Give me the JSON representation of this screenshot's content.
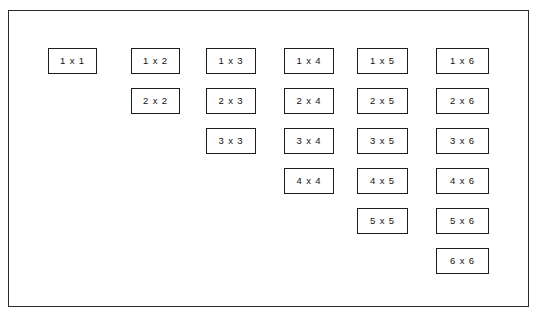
{
  "diagram": {
    "background_color": "#ffffff",
    "frame": {
      "name": "outer-frame",
      "border_color": "#2b2b2b",
      "x": 8,
      "y": 10,
      "width": 521,
      "height": 297
    },
    "box_style": {
      "border_color": "#1d1d1d",
      "fill_color": "#ffffff",
      "text_color": "#111111",
      "height": 26
    },
    "separator": "x",
    "columns": [
      {
        "index": 1,
        "x": 48,
        "width": 49,
        "rows": 1
      },
      {
        "index": 2,
        "x": 131,
        "width": 49,
        "rows": 2
      },
      {
        "index": 3,
        "x": 206,
        "width": 50,
        "rows": 3
      },
      {
        "index": 4,
        "x": 284,
        "width": 50,
        "rows": 4
      },
      {
        "index": 5,
        "x": 357,
        "width": 51,
        "rows": 5
      },
      {
        "index": 6,
        "x": 436,
        "width": 53,
        "rows": 6
      }
    ],
    "row_tops": [
      48,
      88,
      128,
      168,
      208,
      248
    ],
    "boxes": [
      {
        "label": "1 x 1",
        "col": 1,
        "row": 1
      },
      {
        "label": "1 x 2",
        "col": 2,
        "row": 1
      },
      {
        "label": "2 x 2",
        "col": 2,
        "row": 2
      },
      {
        "label": "1 x 3",
        "col": 3,
        "row": 1
      },
      {
        "label": "2 x 3",
        "col": 3,
        "row": 2
      },
      {
        "label": "3 x 3",
        "col": 3,
        "row": 3
      },
      {
        "label": "1 x 4",
        "col": 4,
        "row": 1
      },
      {
        "label": "2 x 4",
        "col": 4,
        "row": 2
      },
      {
        "label": "3 x 4",
        "col": 4,
        "row": 3
      },
      {
        "label": "4 x 4",
        "col": 4,
        "row": 4
      },
      {
        "label": "1 x 5",
        "col": 5,
        "row": 1
      },
      {
        "label": "2 x 5",
        "col": 5,
        "row": 2
      },
      {
        "label": "3 x 5",
        "col": 5,
        "row": 3
      },
      {
        "label": "4 x 5",
        "col": 5,
        "row": 4
      },
      {
        "label": "5 x 5",
        "col": 5,
        "row": 5
      },
      {
        "label": "1 x 6",
        "col": 6,
        "row": 1
      },
      {
        "label": "2 x 6",
        "col": 6,
        "row": 2
      },
      {
        "label": "3 x 6",
        "col": 6,
        "row": 3
      },
      {
        "label": "4 x 6",
        "col": 6,
        "row": 4
      },
      {
        "label": "5 x 6",
        "col": 6,
        "row": 5
      },
      {
        "label": "6 x 6",
        "col": 6,
        "row": 6
      }
    ]
  }
}
